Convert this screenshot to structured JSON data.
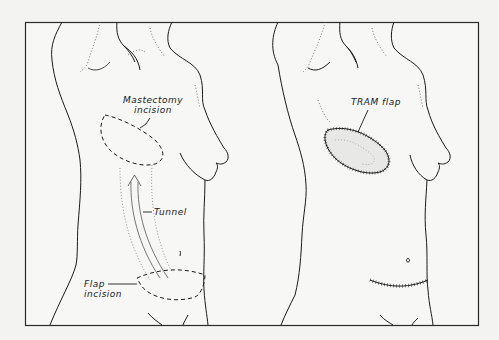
{
  "figure": {
    "left_panel": {
      "title": "Before reconstruction",
      "labels": {
        "mastectomy_line1": "Mastectomy",
        "mastectomy_line2": "incision",
        "tunnel": "Tunnel",
        "flap_line1": "Flap",
        "flap_line2": "incision"
      }
    },
    "right_panel": {
      "title": "After reconstruction",
      "labels": {
        "tram_flap": "TRAM flap"
      }
    }
  },
  "colors": {
    "background": "#f3f3f1",
    "ink": "#1a1a1a",
    "frame": "#2a2a2a"
  }
}
